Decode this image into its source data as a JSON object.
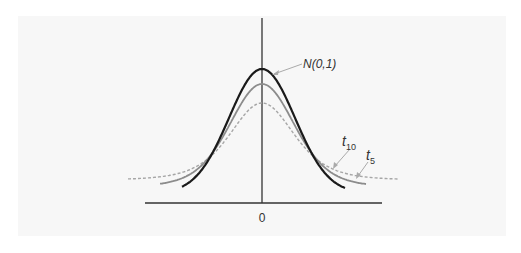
{
  "chart_data": {
    "type": "line",
    "title": "",
    "xlabel": "",
    "ylabel": "",
    "x_tick_labels": [
      "0"
    ],
    "grid": false,
    "legend": "inline annotations with leader arrows",
    "xlim": [
      -4,
      4
    ],
    "series": [
      {
        "name": "N(0,1)",
        "label": "N(0,1)",
        "distribution": "standard normal",
        "peak": 0.399,
        "style": "solid",
        "color": "#1a1a1a",
        "width": 2.2
      },
      {
        "name": "t10",
        "label_base": "t",
        "label_sub": "10",
        "distribution": "Student t, df=10",
        "peak": 0.389,
        "style": "solid",
        "color": "#8c8c8c",
        "width": 1.8
      },
      {
        "name": "t5",
        "label_base": "t",
        "label_sub": "5",
        "distribution": "Student t, df=5",
        "peak": 0.38,
        "style": "dashed",
        "color": "#a6a6a6",
        "width": 1.4
      }
    ],
    "annotations": [
      {
        "text": "N(0,1)",
        "points_to": "N(0,1) peak"
      },
      {
        "text": "t10",
        "points_to": "t10 right tail"
      },
      {
        "text": "t5",
        "points_to": "t5 right tail"
      }
    ]
  },
  "labels": {
    "normal": "N(0,1)",
    "t10_base": "t",
    "t10_sub": "10",
    "t5_base": "t",
    "t5_sub": "5",
    "zero": "0"
  }
}
